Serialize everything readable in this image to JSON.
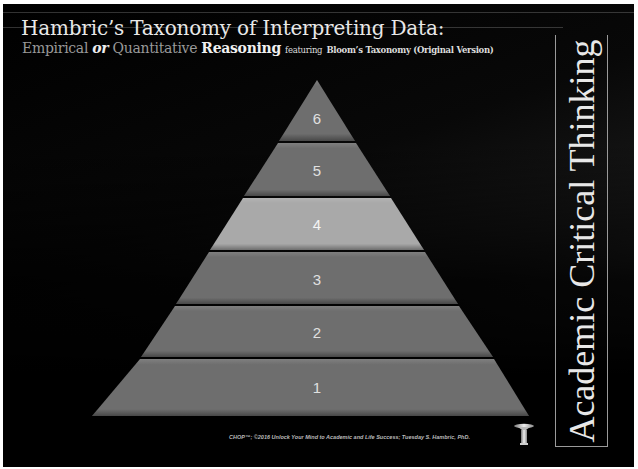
{
  "title": "Hambric’s Taxonomy of Interpreting Data:",
  "subtitle": {
    "empirical": "Empirical",
    "or": "or",
    "quantitative": "Quantitative",
    "reasoning": "Reasoning",
    "featuring": "featuring",
    "bloom": "Bloom’s Taxonomy (Original Version)"
  },
  "side_label": "Academic Critical Thinking",
  "pyramid": {
    "tiers": [
      {
        "label": "6",
        "color": "#6e6e6e"
      },
      {
        "label": "5",
        "color": "#6e6e6e"
      },
      {
        "label": "4",
        "color": "#a9a9a9",
        "highlighted": true
      },
      {
        "label": "3",
        "color": "#6e6e6e"
      },
      {
        "label": "2",
        "color": "#6e6e6e"
      },
      {
        "label": "1",
        "color": "#6e6e6e"
      }
    ]
  },
  "footer": "CHOP™; ©2016 Unlock Your Mind to Academic and Life Success; Tuesday S. Hambric, PhD.",
  "icons": {
    "pedestal": "pedestal-icon"
  }
}
